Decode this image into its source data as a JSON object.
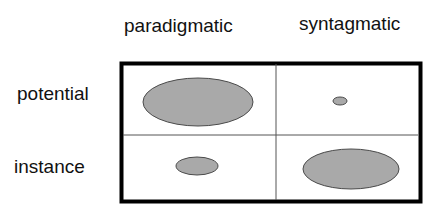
{
  "diagram": {
    "column_headers": [
      "paradigmatic",
      "syntagmatic"
    ],
    "row_headers": [
      "potential",
      "instance"
    ],
    "cells": [
      {
        "row": "potential",
        "column": "paradigmatic",
        "ellipse_size": "large",
        "cx": 198,
        "cy": 102,
        "rx": 55,
        "ry": 24
      },
      {
        "row": "potential",
        "column": "syntagmatic",
        "ellipse_size": "tiny",
        "cx": 340,
        "cy": 101,
        "rx": 7,
        "ry": 4
      },
      {
        "row": "instance",
        "column": "paradigmatic",
        "ellipse_size": "small",
        "cx": 197,
        "cy": 166,
        "rx": 21,
        "ry": 9
      },
      {
        "row": "instance",
        "column": "syntagmatic",
        "ellipse_size": "large",
        "cx": 351,
        "cy": 169,
        "rx": 48,
        "ry": 20
      }
    ],
    "colors": {
      "ellipse_fill": "#a9a9a9",
      "ellipse_stroke": "#4a4a4a",
      "frame": "#000000",
      "divider": "#555555"
    }
  }
}
